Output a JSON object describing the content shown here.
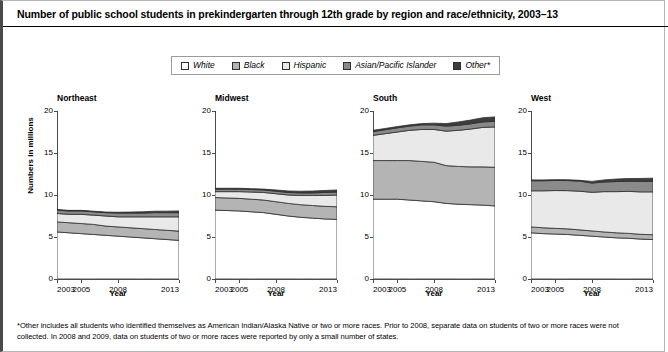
{
  "title": "Number of public school students in prekindergarten through 12th grade by region and race/ethnicity, 2003–13",
  "ylabel": "Numbers in millions",
  "xlabel": "Year",
  "footnote": "*Other includes all students who identified themselves as American Indian/Alaska Native or two or more races. Prior to 2008, separate data on students of two or more races were not collected. In 2008 and 2009, data on students of two or more races were reported by only a small number of states.",
  "legend": {
    "items": [
      {
        "label": "White",
        "color": "#ffffff"
      },
      {
        "label": "Black",
        "color": "#b4b4b4"
      },
      {
        "label": "Hispanic",
        "color": "#e9e9e9"
      },
      {
        "label": "Asian/Pacific Islander",
        "color": "#8a8a8a"
      },
      {
        "label": "Other*",
        "color": "#3d3d3d"
      }
    ]
  },
  "chart_data": {
    "type": "area",
    "title": "Number of public school students in prekindergarten through 12th grade by region and race/ethnicity, 2003–13",
    "xlabel": "Year",
    "ylabel": "Numbers in millions",
    "grid": false,
    "legend_position": "top-center",
    "ylim": [
      0,
      20
    ],
    "yticks": [
      0,
      5,
      10,
      15,
      20
    ],
    "xlim": [
      2003,
      2013
    ],
    "xticks": [
      2003,
      2005,
      2008,
      2013
    ],
    "xtick_labels": [
      "2003",
      "2005",
      "2008",
      "2013"
    ],
    "x": [
      2003,
      2004,
      2005,
      2006,
      2007,
      2008,
      2009,
      2010,
      2011,
      2012,
      2013
    ],
    "stacked": true,
    "series_order": [
      "White",
      "Black",
      "Hispanic",
      "Asian/Pacific Islander",
      "Other*"
    ],
    "panels": [
      {
        "name": "Northeast",
        "series": [
          {
            "name": "White",
            "values": [
              5.6,
              5.5,
              5.4,
              5.3,
              5.2,
              5.1,
              5.0,
              4.9,
              4.8,
              4.7,
              4.6
            ]
          },
          {
            "name": "Black",
            "values": [
              1.2,
              1.2,
              1.2,
              1.2,
              1.1,
              1.1,
              1.1,
              1.1,
              1.1,
              1.1,
              1.1
            ]
          },
          {
            "name": "Hispanic",
            "values": [
              1.0,
              1.0,
              1.1,
              1.1,
              1.2,
              1.2,
              1.3,
              1.4,
              1.5,
              1.6,
              1.7
            ]
          },
          {
            "name": "Asian/Pacific Islander",
            "values": [
              0.4,
              0.4,
              0.4,
              0.4,
              0.4,
              0.45,
              0.45,
              0.45,
              0.5,
              0.5,
              0.5
            ]
          },
          {
            "name": "Other*",
            "values": [
              0.07,
              0.07,
              0.07,
              0.07,
              0.07,
              0.1,
              0.12,
              0.15,
              0.17,
              0.18,
              0.2
            ]
          }
        ]
      },
      {
        "name": "Midwest",
        "series": [
          {
            "name": "White",
            "values": [
              8.2,
              8.15,
              8.1,
              8.0,
              7.9,
              7.7,
              7.5,
              7.35,
              7.25,
              7.15,
              7.1
            ]
          },
          {
            "name": "Black",
            "values": [
              1.5,
              1.5,
              1.5,
              1.5,
              1.5,
              1.5,
              1.5,
              1.5,
              1.5,
              1.5,
              1.5
            ]
          },
          {
            "name": "Hispanic",
            "values": [
              0.7,
              0.75,
              0.8,
              0.85,
              0.9,
              0.95,
              1.0,
              1.1,
              1.2,
              1.3,
              1.4
            ]
          },
          {
            "name": "Asian/Pacific Islander",
            "values": [
              0.3,
              0.3,
              0.3,
              0.3,
              0.3,
              0.3,
              0.3,
              0.3,
              0.3,
              0.35,
              0.35
            ]
          },
          {
            "name": "Other*",
            "values": [
              0.1,
              0.1,
              0.1,
              0.1,
              0.1,
              0.15,
              0.18,
              0.2,
              0.22,
              0.24,
              0.25
            ]
          }
        ]
      },
      {
        "name": "South",
        "series": [
          {
            "name": "White",
            "values": [
              9.5,
              9.5,
              9.5,
              9.4,
              9.3,
              9.2,
              9.0,
              8.9,
              8.85,
              8.8,
              8.7
            ]
          },
          {
            "name": "Black",
            "values": [
              4.6,
              4.6,
              4.6,
              4.7,
              4.7,
              4.7,
              4.5,
              4.5,
              4.5,
              4.55,
              4.6
            ]
          },
          {
            "name": "Hispanic",
            "values": [
              3.0,
              3.2,
              3.4,
              3.6,
              3.8,
              3.9,
              4.1,
              4.3,
              4.5,
              4.7,
              4.8
            ]
          },
          {
            "name": "Asian/Pacific Islander",
            "values": [
              0.45,
              0.47,
              0.5,
              0.5,
              0.55,
              0.55,
              0.6,
              0.6,
              0.62,
              0.65,
              0.67
            ]
          },
          {
            "name": "Other*",
            "values": [
              0.15,
              0.15,
              0.15,
              0.15,
              0.15,
              0.2,
              0.3,
              0.4,
              0.45,
              0.5,
              0.53
            ]
          }
        ]
      },
      {
        "name": "West",
        "series": [
          {
            "name": "White",
            "values": [
              5.5,
              5.4,
              5.35,
              5.3,
              5.2,
              5.1,
              5.0,
              4.9,
              4.85,
              4.75,
              4.7
            ]
          },
          {
            "name": "Black",
            "values": [
              0.7,
              0.7,
              0.68,
              0.67,
              0.65,
              0.62,
              0.6,
              0.6,
              0.58,
              0.57,
              0.57
            ]
          },
          {
            "name": "Hispanic",
            "values": [
              4.3,
              4.4,
              4.5,
              4.55,
              4.6,
              4.6,
              4.8,
              4.9,
              5.0,
              5.05,
              5.1
            ]
          },
          {
            "name": "Asian/Pacific Islander",
            "values": [
              1.2,
              1.2,
              1.2,
              1.2,
              1.2,
              1.1,
              1.15,
              1.2,
              1.2,
              1.25,
              1.25
            ]
          },
          {
            "name": "Other*",
            "values": [
              0.1,
              0.1,
              0.1,
              0.1,
              0.1,
              0.2,
              0.25,
              0.3,
              0.33,
              0.35,
              0.38
            ]
          }
        ]
      }
    ]
  }
}
